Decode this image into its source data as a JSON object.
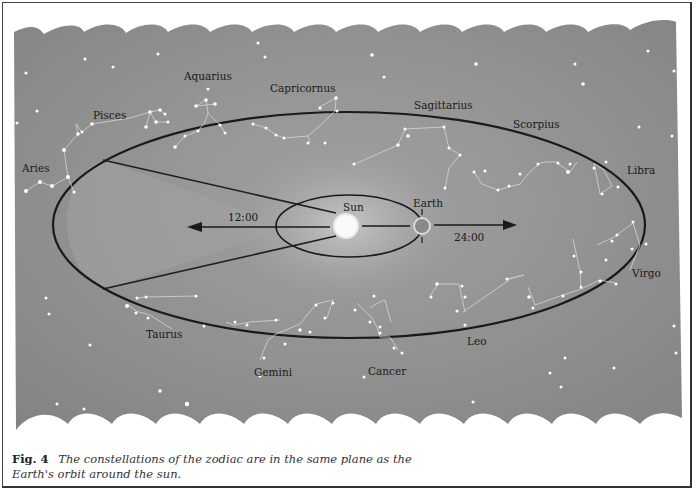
{
  "figure": {
    "number_label": "Fig. 4",
    "caption": "The constellations of the zodiac are in the same plane as the Earth's orbit around the sun."
  },
  "labels": {
    "sun": "Sun",
    "earth": "Earth",
    "time_noon": "12:00",
    "time_midnight": "24:00"
  },
  "constellations": [
    {
      "name": "Aries"
    },
    {
      "name": "Pisces"
    },
    {
      "name": "Aquarius"
    },
    {
      "name": "Capricornus"
    },
    {
      "name": "Sagittarius"
    },
    {
      "name": "Scorpius"
    },
    {
      "name": "Libra"
    },
    {
      "name": "Virgo"
    },
    {
      "name": "Leo"
    },
    {
      "name": "Cancer"
    },
    {
      "name": "Gemini"
    },
    {
      "name": "Taurus"
    }
  ],
  "colors": {
    "sky": "#8c8c8c",
    "ecliptic_line": "#1e1e1e",
    "star": "#ffffff",
    "sun": "#fafafa",
    "shaded_cone": "#a3a3a3"
  }
}
